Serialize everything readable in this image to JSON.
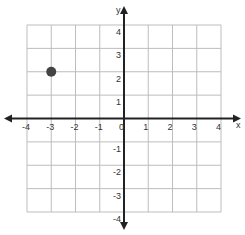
{
  "chart_data": {
    "type": "scatter",
    "title": "",
    "xlabel": "x",
    "ylabel": "y",
    "xlim": [
      -4,
      4
    ],
    "ylim": [
      -4,
      4
    ],
    "grid": true,
    "x_ticks": [
      "-4",
      "-3",
      "-2",
      "-1",
      "0",
      "1",
      "2",
      "3",
      "4"
    ],
    "y_ticks": [
      "4",
      "3",
      "2",
      "1",
      "-1",
      "-2",
      "-3",
      "-4"
    ],
    "points": [
      {
        "x": -3,
        "y": 2
      }
    ]
  },
  "colors": {
    "grid": "#bdbdbd",
    "axis": "#222222",
    "point": "#444444"
  }
}
